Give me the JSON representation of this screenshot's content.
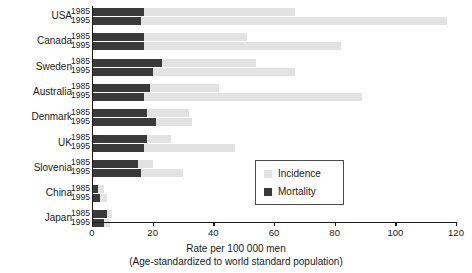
{
  "chart_data": {
    "type": "bar",
    "orientation": "horizontal",
    "title": "",
    "xlabel": "Rate per 100 000 men",
    "xlabel_sub": "(Age-standardized to world standard population)",
    "ylabel": "",
    "xlim": [
      0,
      120
    ],
    "xticks": [
      0,
      20,
      40,
      60,
      80,
      100,
      120
    ],
    "xtick_labels": [
      "0",
      "20",
      "40",
      "60",
      "80",
      "100",
      "120"
    ],
    "grid": false,
    "legend_position": "center-right",
    "legend": [
      "Incidence",
      "Mortality"
    ],
    "colors": {
      "incidence": "#e2e2e2",
      "mortality": "#3a3a3a",
      "axis": "#1a1a1a",
      "background": "#ffffff"
    },
    "categories": [
      "USA",
      "Canada",
      "Sweden",
      "Australia",
      "Denmark",
      "UK",
      "Slovenia",
      "China",
      "Japan"
    ],
    "years": [
      "1985",
      "1995"
    ],
    "series": [
      {
        "name": "Incidence",
        "values_1985": [
          67,
          51,
          54,
          42,
          32,
          26,
          20,
          4,
          6.5
        ],
        "values_1995": [
          117,
          82,
          67,
          89,
          33,
          47,
          30,
          5,
          6
        ]
      },
      {
        "name": "Mortality",
        "values_1985": [
          17,
          17,
          23,
          19,
          18,
          18,
          15,
          2,
          5
        ],
        "values_1995": [
          16,
          17,
          20,
          17,
          21,
          17,
          16,
          2.5,
          4
        ]
      }
    ],
    "groups": [
      {
        "country": "USA",
        "rows": [
          {
            "year": "1985",
            "incidence": 67,
            "mortality": 17
          },
          {
            "year": "1995",
            "incidence": 117,
            "mortality": 16
          }
        ]
      },
      {
        "country": "Canada",
        "rows": [
          {
            "year": "1985",
            "incidence": 51,
            "mortality": 17
          },
          {
            "year": "1995",
            "incidence": 82,
            "mortality": 17
          }
        ]
      },
      {
        "country": "Sweden",
        "rows": [
          {
            "year": "1985",
            "incidence": 54,
            "mortality": 23
          },
          {
            "year": "1995",
            "incidence": 67,
            "mortality": 20
          }
        ]
      },
      {
        "country": "Australia",
        "rows": [
          {
            "year": "1985",
            "incidence": 42,
            "mortality": 19
          },
          {
            "year": "1995",
            "incidence": 89,
            "mortality": 17
          }
        ]
      },
      {
        "country": "Denmark",
        "rows": [
          {
            "year": "1985",
            "incidence": 32,
            "mortality": 18
          },
          {
            "year": "1995",
            "incidence": 33,
            "mortality": 21
          }
        ]
      },
      {
        "country": "UK",
        "rows": [
          {
            "year": "1985",
            "incidence": 26,
            "mortality": 18
          },
          {
            "year": "1995",
            "incidence": 47,
            "mortality": 17
          }
        ]
      },
      {
        "country": "Slovenia",
        "rows": [
          {
            "year": "1985",
            "incidence": 20,
            "mortality": 15
          },
          {
            "year": "1995",
            "incidence": 30,
            "mortality": 16
          }
        ]
      },
      {
        "country": "China",
        "rows": [
          {
            "year": "1985",
            "incidence": 4,
            "mortality": 2
          },
          {
            "year": "1995",
            "incidence": 5,
            "mortality": 2.5
          }
        ]
      },
      {
        "country": "Japan",
        "rows": [
          {
            "year": "1985",
            "incidence": 6.5,
            "mortality": 5
          },
          {
            "year": "1995",
            "incidence": 6,
            "mortality": 4
          }
        ]
      }
    ]
  }
}
